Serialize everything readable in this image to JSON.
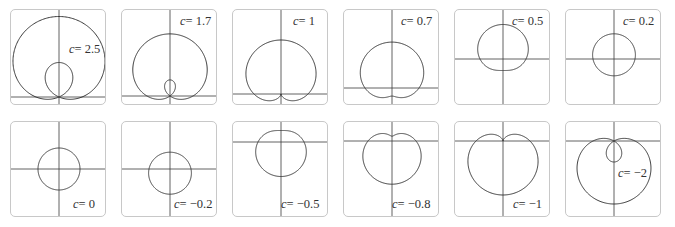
{
  "figure": {
    "label_prefix": "c",
    "panels": [
      {
        "c": 2.5,
        "text": "= 2.5",
        "left": 10,
        "top": 9,
        "ox": 48,
        "oy": 87,
        "scale": 23,
        "lx": 58,
        "ly": 32
      },
      {
        "c": 1.7,
        "text": "= 1.7",
        "left": 121,
        "top": 9,
        "ox": 48,
        "oy": 86,
        "scale": 23,
        "lx": 58,
        "ly": 4
      },
      {
        "c": 1,
        "text": "= 1",
        "left": 232,
        "top": 9,
        "ox": 48,
        "oy": 84,
        "scale": 27,
        "lx": 60,
        "ly": 4
      },
      {
        "c": 0.7,
        "text": "= 0.7",
        "left": 343,
        "top": 9,
        "ox": 48,
        "oy": 78,
        "scale": 27,
        "lx": 57,
        "ly": 4
      },
      {
        "c": 0.5,
        "text": "= 0.5",
        "left": 454,
        "top": 9,
        "ox": 48,
        "oy": 49,
        "scale": 23,
        "lx": 57,
        "ly": 4
      },
      {
        "c": 0.2,
        "text": "= 0.2",
        "left": 565,
        "top": 9,
        "ox": 48,
        "oy": 49,
        "scale": 21,
        "lx": 57,
        "ly": 4
      },
      {
        "c": 0,
        "text": "= 0",
        "left": 10,
        "top": 121,
        "ox": 48,
        "oy": 47,
        "scale": 21,
        "lx": 62,
        "ly": 75
      },
      {
        "c": -0.2,
        "text": "= −0.2",
        "left": 121,
        "top": 121,
        "ox": 48,
        "oy": 47,
        "scale": 21,
        "lx": 52,
        "ly": 75
      },
      {
        "c": -0.5,
        "text": "= −0.5",
        "left": 232,
        "top": 121,
        "ox": 48,
        "oy": 20,
        "scale": 23,
        "lx": 48,
        "ly": 75
      },
      {
        "c": -0.8,
        "text": "= −0.8",
        "left": 343,
        "top": 121,
        "ox": 48,
        "oy": 19,
        "scale": 24,
        "lx": 48,
        "ly": 75
      },
      {
        "c": -1,
        "text": "= −1",
        "left": 454,
        "top": 121,
        "ox": 48,
        "oy": 19,
        "scale": 27,
        "lx": 58,
        "ly": 75
      },
      {
        "c": -2,
        "text": "= −2",
        "left": 565,
        "top": 121,
        "ox": 48,
        "oy": 19,
        "scale": 21,
        "lx": 52,
        "ly": 44
      }
    ]
  },
  "chart_data": {
    "type": "line",
    "title": "",
    "equation": "r = 1 + c sin(theta)",
    "grid": false,
    "layout": "2 rows x 6 columns of small polar plots",
    "series": [
      {
        "name": "c = 2.5",
        "c": 2.5
      },
      {
        "name": "c = 1.7",
        "c": 1.7
      },
      {
        "name": "c = 1",
        "c": 1
      },
      {
        "name": "c = 0.7",
        "c": 0.7
      },
      {
        "name": "c = 0.5",
        "c": 0.5
      },
      {
        "name": "c = 0.2",
        "c": 0.2
      },
      {
        "name": "c = 0",
        "c": 0
      },
      {
        "name": "c = -0.2",
        "c": -0.2
      },
      {
        "name": "c = -0.5",
        "c": -0.5
      },
      {
        "name": "c = -0.8",
        "c": -0.8
      },
      {
        "name": "c = -1",
        "c": -1
      },
      {
        "name": "c = -2",
        "c": -2
      }
    ],
    "xlabel": "",
    "ylabel": ""
  }
}
